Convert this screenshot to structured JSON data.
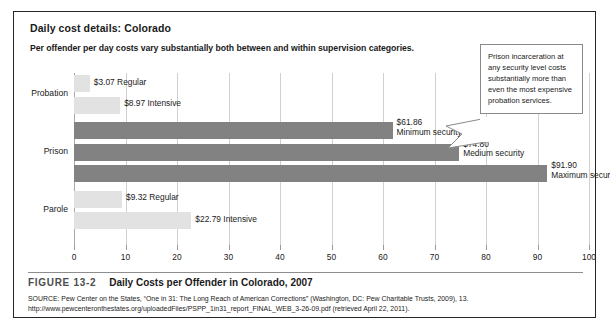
{
  "box": {
    "title": "Daily cost details: Colorado",
    "subtitle": "Per offender per day costs vary substantially both between and within supervision categories."
  },
  "callout": {
    "text": "Prison incarceration at any security level costs substantially more than even the most expensive probation services."
  },
  "figure": {
    "number": "FIGURE 13-2",
    "title": "Daily Costs per Offender in Colorado, 2007",
    "source_line_1": "SOURCE: Pew Center on the States, “One in 31: The Long Reach of American Corrections” (Washington, DC: Pew Charitable Trusts, 2009), 13.",
    "source_line_2": "http://www.pewcenteronthestates.org/uploadedFiles/PSPP_1in31_report_FINAL_WEB_3-26-09.pdf (retrieved April 22, 2011)."
  },
  "chart_data": {
    "type": "bar",
    "orientation": "horizontal",
    "title": "Daily Costs per Offender in Colorado, 2007",
    "xlabel": "",
    "ylabel": "",
    "xlim": [
      0,
      100
    ],
    "xticks": [
      0,
      10,
      20,
      30,
      40,
      50,
      60,
      70,
      80,
      90,
      100
    ],
    "grid": true,
    "legend": "none",
    "groups": [
      "Probation",
      "Prison",
      "Parole"
    ],
    "bars": [
      {
        "group": "Probation",
        "label": "Regular",
        "value": 3.07,
        "value_label": "$3.07",
        "shade": "light",
        "label_text": "$3.07 Regular",
        "label_lines": [
          "$3.07 Regular"
        ]
      },
      {
        "group": "Probation",
        "label": "Intensive",
        "value": 8.97,
        "value_label": "$8.97",
        "shade": "light",
        "label_text": "$8.97 Intensive",
        "label_lines": [
          "$8.97 Intensive"
        ]
      },
      {
        "group": "Prison",
        "label": "Minimum security",
        "value": 61.86,
        "value_label": "$61.86",
        "shade": "dark",
        "label_text": "$61.86 Minimum security",
        "label_lines": [
          "$61.86",
          "Minimum security"
        ]
      },
      {
        "group": "Prison",
        "label": "Medium security",
        "value": 74.8,
        "value_label": "$74.80",
        "shade": "dark",
        "label_text": "$74.80 Medium security",
        "label_lines": [
          "$74.80",
          "Medium security"
        ]
      },
      {
        "group": "Prison",
        "label": "Maximum security",
        "value": 91.9,
        "value_label": "$91.90",
        "shade": "dark",
        "label_text": "$91.90 Maximum security",
        "label_lines": [
          "$91.90",
          "Maximum security"
        ]
      },
      {
        "group": "Parole",
        "label": "Regular",
        "value": 9.32,
        "value_label": "$9.32",
        "shade": "light",
        "label_text": "$9.32 Regular",
        "label_lines": [
          "$9.32 Regular"
        ]
      },
      {
        "group": "Parole",
        "label": "Intensive",
        "value": 22.79,
        "value_label": "$22.79",
        "shade": "light",
        "label_text": "$22.79 Intensive",
        "label_lines": [
          "$22.79 Intensive"
        ]
      }
    ],
    "colors": {
      "light_bar": "#e2e2e2",
      "dark_bar": "#828282",
      "gridline": "#d0d0d0",
      "text": "#1a1a1a"
    }
  }
}
